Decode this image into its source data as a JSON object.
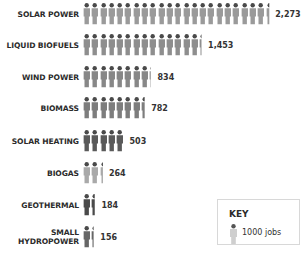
{
  "chart_data": {
    "type": "bar",
    "style": "pictogram",
    "title": "",
    "xlabel": "",
    "ylabel": "",
    "categories": [
      "SOLAR POWER",
      "LIQUID BIOFUELS",
      "WIND POWER",
      "BIOMASS",
      "SOLAR HEATING",
      "BIOGAS",
      "GEOTHERMAL",
      "SMALL HYDROPOWER"
    ],
    "values": [
      2273,
      1453,
      834,
      782,
      503,
      264,
      184,
      156
    ],
    "value_labels": [
      "2,273",
      "1,453",
      "834",
      "782",
      "503",
      "264",
      "184",
      "156"
    ],
    "units_per_icon": 100,
    "legend": {
      "title": "KEY",
      "entry": "1000 jobs"
    },
    "grid": false,
    "legend_position": "bottom-right"
  },
  "rows": [
    {
      "label": "SOLAR POWER",
      "value": "2,273",
      "icons": 22.73,
      "color": "#9a9a9a",
      "top": 3
    },
    {
      "label": "LIQUID BIOFUELS",
      "value": "1,453",
      "icons": 14.53,
      "color": "#8e8e8e",
      "top": 34
    },
    {
      "label": "WIND POWER",
      "value": "834",
      "icons": 8.34,
      "color": "#878787",
      "top": 66
    },
    {
      "label": "BIOMASS",
      "value": "782",
      "icons": 7.82,
      "color": "#7d7d7d",
      "top": 97
    },
    {
      "label": "SOLAR HEATING",
      "value": "503",
      "icons": 5.03,
      "color": "#5a5a5a",
      "top": 130
    },
    {
      "label": "BIOGAS",
      "value": "264",
      "icons": 2.64,
      "color": "#a9a9a9",
      "top": 162
    },
    {
      "label": "GEOTHERMAL",
      "value": "184",
      "icons": 1.84,
      "color": "#4a4a4a",
      "top": 194
    },
    {
      "label": "SMALL\nHYDROPOWER",
      "value": "156",
      "icons": 1.56,
      "color": "#666666",
      "top": 226
    }
  ],
  "key": {
    "title": "KEY",
    "text": "1000 jobs",
    "icon": "person-icon",
    "color": "#c4c4c4"
  }
}
